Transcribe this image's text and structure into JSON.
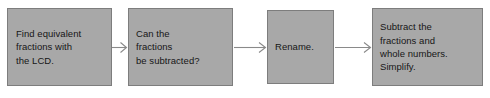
{
  "diagram": {
    "type": "flowchart",
    "orientation": "left-to-right",
    "background_color": "#ffffff",
    "node_fill_color": "#a8a8a8",
    "node_border_color": "#7d7d7d",
    "text_color": "#161616",
    "connector_color": "#8a8a8a",
    "nodes": [
      {
        "id": "find-equivalent-fractions",
        "label": "Find equivalent\nfractions with\nthe LCD."
      },
      {
        "id": "can-fractions-be-subtracted",
        "label": "Can the\nfractions\nbe subtracted?"
      },
      {
        "id": "rename",
        "label": "Rename."
      },
      {
        "id": "subtract-and-simplify",
        "label": "Subtract the\nfractions and\nwhole numbers.\nSimplify."
      }
    ],
    "connectors": [
      {
        "id": "arrow-1",
        "from": "find-equivalent-fractions",
        "to": "can-fractions-be-subtracted",
        "arrowhead": "open-v"
      },
      {
        "id": "arrow-2",
        "from": "can-fractions-be-subtracted",
        "to": "rename",
        "arrowhead": "open-v"
      },
      {
        "id": "arrow-3",
        "from": "rename",
        "to": "subtract-and-simplify",
        "arrowhead": "open-v"
      }
    ]
  }
}
